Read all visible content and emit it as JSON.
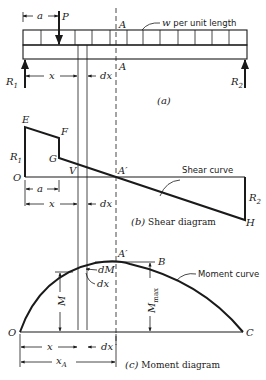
{
  "figure": {
    "beam": {
      "caption": "(a)",
      "load_label": "w per unit length",
      "point_load": "P",
      "dim_a": "a",
      "dim_x": "x",
      "dim_dx": "dx",
      "section_label_top": "A",
      "section_label_bottom": "A",
      "left_reaction": "R",
      "left_reaction_sub": "1",
      "right_reaction": "R",
      "right_reaction_sub": "2"
    },
    "shear": {
      "caption_part": "(b)",
      "caption_text": "Shear diagram",
      "curve_label": "Shear curve",
      "point_E": "E",
      "point_F": "F",
      "point_G": "G",
      "point_O": "O",
      "point_A": "A′",
      "point_H": "H",
      "V_label": "V",
      "left_reaction": "R",
      "left_reaction_sub": "1",
      "right_reaction": "R",
      "right_reaction_sub": "2",
      "dim_a": "a",
      "dim_x": "x",
      "dim_dx": "dx"
    },
    "moment": {
      "caption_part": "(c)",
      "caption_text": "Moment diagram",
      "curve_label": "Moment curve",
      "point_O": "O",
      "point_C": "C",
      "point_A": "A′",
      "point_B": "B",
      "dM_label": "dM",
      "dx_label": "dx",
      "M_label": "M",
      "Mmax_label": "M",
      "Mmax_sub": "max",
      "dim_x": "x",
      "dim_dx": "dx",
      "dim_xA": "x",
      "dim_xA_sub": "A"
    }
  }
}
